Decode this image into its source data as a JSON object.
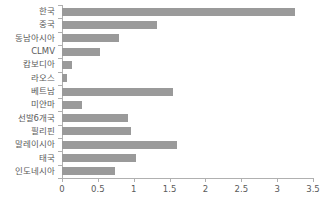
{
  "chart_data": {
    "type": "bar",
    "orientation": "horizontal",
    "title": "",
    "xlabel": "",
    "ylabel": "",
    "xlim": [
      0,
      3.5
    ],
    "xticks": [
      "0",
      "0.5",
      "1",
      "1.5",
      "2",
      "2.5",
      "3",
      "3.5"
    ],
    "xtick_values": [
      0,
      0.5,
      1,
      1.5,
      2,
      2.5,
      3,
      3.5
    ],
    "grid": false,
    "legend": false,
    "bar_color": "#9a9a9a",
    "axis_color": "#b0b0b0",
    "text_color": "#5a5a5a",
    "categories": [
      "한국",
      "중국",
      "동남아시아",
      "CLMV",
      "캄보디아",
      "라오스",
      "베트남",
      "미얀마",
      "선발6개국",
      "필리핀",
      "말레이시아",
      "태국",
      "인도네시아"
    ],
    "values": [
      3.25,
      1.33,
      0.8,
      0.53,
      0.14,
      0.07,
      1.55,
      0.28,
      0.92,
      0.96,
      1.61,
      1.03,
      0.74
    ]
  }
}
